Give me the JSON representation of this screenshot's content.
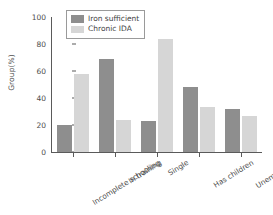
{
  "chart_data": {
    "type": "bar",
    "title": "",
    "xlabel": "",
    "ylabel": "Group(%)",
    "ylim": [
      0,
      100
    ],
    "yticks": [
      0,
      20,
      40,
      60,
      80,
      100
    ],
    "grid": false,
    "legend_position": "top-left",
    "categories": [
      "Incomplete schooling",
      "In training",
      "Single",
      "Has children",
      "Unemployed"
    ],
    "series": [
      {
        "name": "Iron sufficient",
        "color": "#8e8e8e",
        "values": [
          20,
          69,
          23,
          48,
          32
        ]
      },
      {
        "name": "Chronic IDA",
        "color": "#d6d6d6",
        "values": [
          58,
          24,
          84,
          33,
          27
        ]
      }
    ]
  },
  "axis": {
    "tick_labels": [
      "100",
      "80",
      "60",
      "40",
      "20",
      "0"
    ]
  }
}
